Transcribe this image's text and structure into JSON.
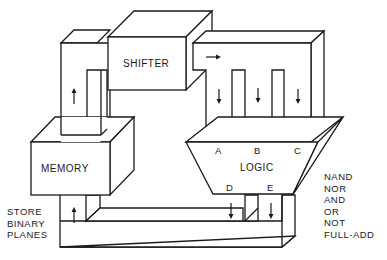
{
  "diagram": {
    "blocks": {
      "shifter": "SHIFTER",
      "memory": "MEMORY",
      "logic": "LOGIC"
    },
    "logic_ports": {
      "inputs": [
        "A",
        "B",
        "C"
      ],
      "outputs": [
        "D",
        "E"
      ]
    },
    "memory_note": [
      "STORE",
      "BINARY",
      "PLANES"
    ],
    "logic_operations": [
      "NAND",
      "NOR",
      "AND",
      "OR",
      "NOT",
      "FULL-ADD"
    ],
    "colors": {
      "line": "#1a1a1a",
      "background": "#ffffff"
    }
  }
}
